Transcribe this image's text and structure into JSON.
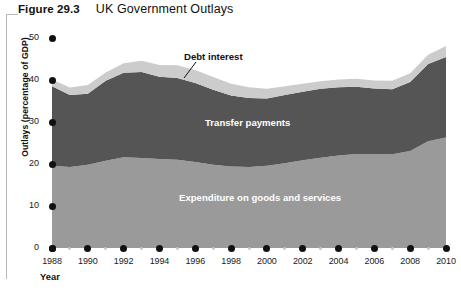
{
  "figure": {
    "number": "Figure 29.3",
    "title": "UK Government Outlays",
    "axis_name_x": "Year",
    "axis_name_y": "Outlays (percentage of GDP)"
  },
  "labels": {
    "debt_interest": "Debt interest",
    "transfer_payments": "Transfer payments",
    "expenditure": "Expenditure on goods and services"
  },
  "colors": {
    "expenditure": "#9a9a9a",
    "transfer": "#555555",
    "debt": "#cccccc",
    "background": "#ffffff",
    "text": "#111111",
    "tick_dot": "#111111",
    "tick_dot_minor": "#c9c9c9",
    "frame": "#b9b9b9"
  },
  "chart_data": {
    "type": "area",
    "title": "UK Government Outlays",
    "xlabel": "Year",
    "ylabel": "Outlays (percentage of GDP)",
    "xlim": [
      1988,
      2010
    ],
    "ylim": [
      0,
      50
    ],
    "ytick_labels": [
      "0",
      "10",
      "20",
      "30",
      "40",
      "50"
    ],
    "ytick_values": [
      0,
      10,
      20,
      30,
      40,
      50
    ],
    "xtick_labels": [
      "1988",
      "1990",
      "1992",
      "1994",
      "1996",
      "1998",
      "2000",
      "2002",
      "2004",
      "2006",
      "2008",
      "2010"
    ],
    "xtick_values": [
      1988,
      1990,
      1992,
      1994,
      1996,
      1998,
      2000,
      2002,
      2004,
      2006,
      2008,
      2010
    ],
    "grid": false,
    "legend": "in-chart band labels",
    "stacked": true,
    "x": [
      1988,
      1989,
      1990,
      1991,
      1992,
      1993,
      1994,
      1995,
      1996,
      1997,
      1998,
      1999,
      2000,
      2001,
      2002,
      2003,
      2004,
      2005,
      2006,
      2007,
      2008,
      2009,
      2010
    ],
    "series": [
      {
        "name": "Expenditure on goods and services",
        "values": [
          19.6,
          19.3,
          19.8,
          20.8,
          21.6,
          21.4,
          21.2,
          21.0,
          20.5,
          19.8,
          19.4,
          19.3,
          19.6,
          20.2,
          20.9,
          21.5,
          22.0,
          22.4,
          22.4,
          22.3,
          23.1,
          25.4,
          26.3
        ]
      },
      {
        "name": "Transfer payments",
        "values": [
          18.9,
          17.1,
          16.9,
          19.0,
          20.1,
          20.5,
          19.6,
          19.5,
          18.8,
          17.9,
          16.9,
          16.4,
          16.0,
          16.2,
          16.3,
          16.4,
          16.3,
          16.0,
          15.6,
          15.5,
          16.4,
          18.4,
          19.2
        ]
      },
      {
        "name": "Debt interest",
        "values": [
          1.6,
          1.8,
          2.1,
          2.0,
          2.3,
          2.7,
          2.8,
          3.0,
          3.1,
          3.0,
          2.8,
          2.6,
          2.3,
          2.1,
          1.9,
          1.8,
          1.8,
          1.9,
          1.9,
          2.0,
          2.1,
          2.2,
          2.6
        ]
      }
    ],
    "totals": [
      40.1,
      38.2,
      38.8,
      41.8,
      44.0,
      44.6,
      43.6,
      43.5,
      42.4,
      40.7,
      39.1,
      38.3,
      37.9,
      38.5,
      39.1,
      39.7,
      40.1,
      40.3,
      39.9,
      39.8,
      41.6,
      46.0,
      48.1
    ]
  }
}
